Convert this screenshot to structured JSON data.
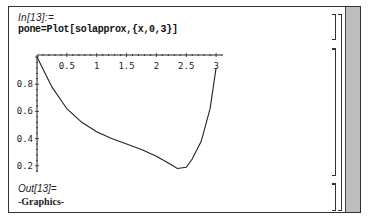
{
  "notebook": {
    "input_cell": {
      "label": "In[13]:=",
      "code": "pone=Plot[solapprox,{x,0,3}]"
    },
    "output_cell": {
      "label": "Out[13]=",
      "value": "-Graphics-"
    }
  },
  "chart_data": {
    "type": "line",
    "title": "",
    "xlabel": "",
    "ylabel": "",
    "function": "solapprox",
    "x_ticks": [
      "0.5",
      "1",
      "1.5",
      "2",
      "2.5",
      "3"
    ],
    "y_ticks": [
      "0.2",
      "0.4",
      "0.6",
      "0.8"
    ],
    "xlim": [
      0,
      3.1
    ],
    "ylim": [
      0.15,
      1.0
    ],
    "grid": false,
    "series": [
      {
        "name": "solapprox",
        "x": [
          0,
          0.25,
          0.5,
          0.75,
          1.0,
          1.25,
          1.5,
          1.75,
          2.0,
          2.2,
          2.35,
          2.5,
          2.6,
          2.75,
          2.9,
          3.0
        ],
        "values": [
          1.0,
          0.78,
          0.62,
          0.52,
          0.45,
          0.4,
          0.36,
          0.32,
          0.27,
          0.22,
          0.18,
          0.19,
          0.25,
          0.38,
          0.62,
          0.92
        ]
      }
    ]
  }
}
